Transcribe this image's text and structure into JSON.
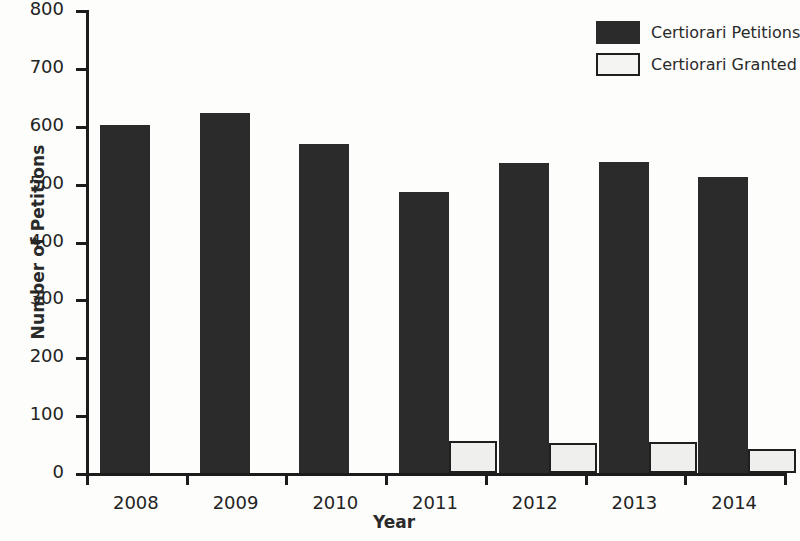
{
  "chart_data": {
    "type": "bar",
    "title": "",
    "xlabel": "Year",
    "ylabel": "Number of Petitions",
    "categories": [
      "2008",
      "2009",
      "2010",
      "2011",
      "2012",
      "2013",
      "2014"
    ],
    "series": [
      {
        "name": "Certiorari Petitions",
        "color": "#2b2b2b",
        "values": [
          602,
          622,
          568,
          485,
          536,
          537,
          511
        ]
      },
      {
        "name": "Certiorari Granted",
        "color": "#efefed",
        "values": [
          0,
          0,
          0,
          55,
          51,
          53,
          41
        ]
      }
    ],
    "ylim": [
      0,
      800
    ],
    "yticks": [
      0,
      100,
      200,
      300,
      400,
      500,
      600,
      700,
      800
    ],
    "ytick_labels": [
      "0",
      "100",
      "200",
      "300",
      "400",
      "500",
      "600",
      "700",
      "800"
    ],
    "grid": false,
    "legend_position": "top-right"
  },
  "legend": {
    "items": [
      {
        "label": "Certiorari Petitions",
        "swatch": "dark"
      },
      {
        "label": "Certiorari Granted",
        "swatch": "light"
      }
    ]
  }
}
